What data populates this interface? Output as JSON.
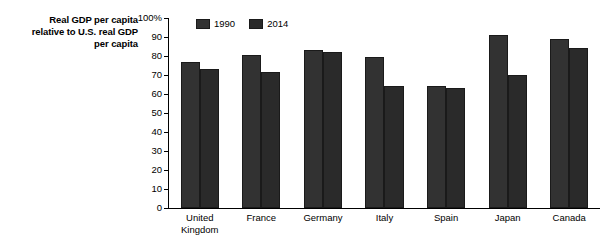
{
  "chart_data": {
    "type": "bar",
    "title": "",
    "xlabel": "",
    "ylabel": "Real GDP per capita relative to U.S. real GDP per capita",
    "ylabel_lines": [
      "Real GDP per capita",
      "relative to U.S. real GDP",
      "per capita"
    ],
    "categories": [
      "United Kingdom",
      "France",
      "Germany",
      "Italy",
      "Spain",
      "Japan",
      "Canada"
    ],
    "category_label_lines": [
      [
        "United",
        "Kingdom"
      ],
      [
        "France"
      ],
      [
        "Germany"
      ],
      [
        "Italy"
      ],
      [
        "Spain"
      ],
      [
        "Japan"
      ],
      [
        "Canada"
      ]
    ],
    "series": [
      {
        "name": "1990",
        "color": "#323232",
        "values": [
          77,
          80.5,
          83,
          79.5,
          64,
          91,
          89
        ]
      },
      {
        "name": "2014",
        "color": "#2a2a2a",
        "values": [
          73,
          71.5,
          82,
          64,
          63,
          70,
          84
        ]
      }
    ],
    "ylim": [
      0,
      100
    ],
    "ytick_values": [
      0,
      10,
      20,
      30,
      40,
      50,
      60,
      70,
      80,
      90,
      100
    ],
    "ytick_labels": [
      "0",
      "10",
      "20",
      "30",
      "40",
      "50",
      "60",
      "70",
      "80",
      "90",
      "100%"
    ],
    "grid": false,
    "legend_position": "top-left-inside",
    "legend_entries": [
      "1990",
      "2014"
    ]
  }
}
